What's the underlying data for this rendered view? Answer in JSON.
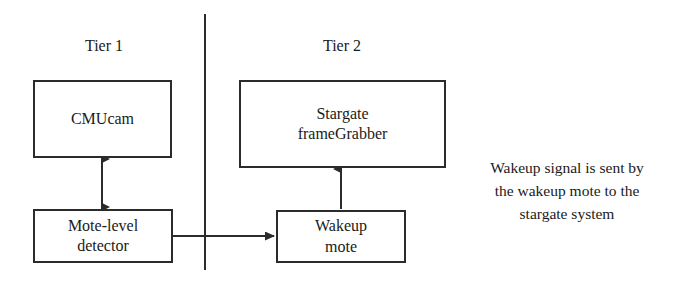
{
  "diagram": {
    "title_tier1": "Tier 1",
    "title_tier2": "Tier 2",
    "nodes": {
      "cmucam": {
        "label": "CMUcam"
      },
      "framegrabber": {
        "line1": "Stargate",
        "line2": "frameGrabber"
      },
      "detector": {
        "line1": "Mote-level",
        "line2": "detector"
      },
      "wakeup_mote": {
        "line1": "Wakeup",
        "line2": "mote"
      }
    },
    "annotation": {
      "line1": "Wakeup signal is sent by",
      "line2": "the wakeup mote to the",
      "line3": "stargate system"
    },
    "colors": {
      "stroke": "#2b2b2b",
      "text": "#1a1a1a",
      "background": "#ffffff"
    }
  }
}
